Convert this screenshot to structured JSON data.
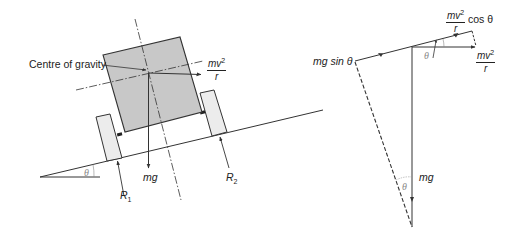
{
  "diagram": {
    "left_panel": {
      "labels": {
        "centre_of_gravity": "Centre of gravity",
        "centrifugal_num": "mv",
        "centrifugal_exp": "2",
        "centrifugal_den": "r",
        "weight": "mg",
        "reaction_1": "R",
        "reaction_1_sub": "1",
        "reaction_2": "R",
        "reaction_2_sub": "2",
        "slope_angle": "θ"
      }
    },
    "right_panel": {
      "labels": {
        "cos_component_num": "mv",
        "cos_component_exp": "2",
        "cos_component_den": "r",
        "cos_component_suffix": "cos θ",
        "centrifugal_num": "mv",
        "centrifugal_exp": "2",
        "centrifugal_den": "r",
        "sin_component": "mg sin θ",
        "weight": "mg",
        "angle_top": "θ",
        "angle_bottom": "θ"
      }
    },
    "colors": {
      "line": "#333333",
      "body_fill": "#c8c8c8",
      "wheel_fill": "#ececec",
      "angle_label": "#8a8a8a"
    }
  }
}
